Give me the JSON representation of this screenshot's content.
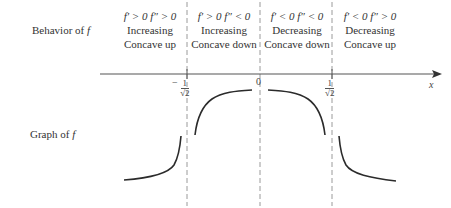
{
  "rows": {
    "behavior_label": "Behavior of",
    "behavior_var": "f",
    "graph_label": "Graph of",
    "graph_var": "f"
  },
  "intervals": [
    {
      "condition_first": "f′ > 0",
      "condition_second": "f″ > 0",
      "line1": "Increasing",
      "line2": "Concave up"
    },
    {
      "condition_first": "f′ > 0",
      "condition_second": "f″ < 0",
      "line1": "Increasing",
      "line2": "Concave down"
    },
    {
      "condition_first": "f′ < 0",
      "condition_second": "f″ < 0",
      "line1": "Decreasing",
      "line2": "Concave down"
    },
    {
      "condition_first": "f′ < 0",
      "condition_second": "f″ > 0",
      "line1": "Decreasing",
      "line2": "Concave up"
    }
  ],
  "axis": {
    "variable": "x",
    "ticks": [
      {
        "sign": "−",
        "numerator": "1",
        "denominator": "√2"
      },
      {
        "sign": "",
        "value": "0"
      },
      {
        "sign": "",
        "numerator": "1",
        "denominator": "√2"
      }
    ]
  },
  "colors": {
    "curve": "#2b2b2b",
    "dashed": "#9a9a9a",
    "axis": "#555555",
    "text": "#333333"
  }
}
